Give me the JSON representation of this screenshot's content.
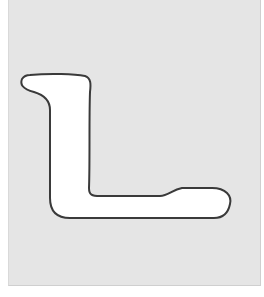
{
  "figure": {
    "panel_color": "#e5e5e5",
    "shape_fill": "#ffffff",
    "outline_color": "#3a3a3a"
  }
}
